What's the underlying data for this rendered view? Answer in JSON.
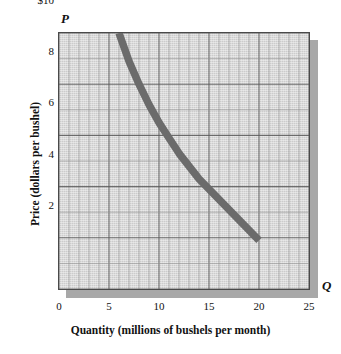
{
  "figure": {
    "axis_symbols": {
      "price": "P",
      "quantity": "Q"
    },
    "y_axis_title": "Price (dollars per bushel)",
    "x_axis_title": "Quantity (millions of bushels per month)"
  },
  "chart_data": {
    "type": "line",
    "title": "",
    "subtitle": "",
    "xlabel": "Quantity (millions of bushels per month)",
    "ylabel": "Price (dollars per bushel)",
    "xlim": [
      0,
      25
    ],
    "ylim": [
      0,
      10
    ],
    "grid": true,
    "grid_major_x_step": 5,
    "grid_major_y_step": 2,
    "grid_minor_x_step": 1,
    "grid_minor_y_step": 1,
    "legend": "none",
    "x_tick_labels": [
      "0",
      "5",
      "10",
      "15",
      "20",
      "25"
    ],
    "x_tick_values": [
      0,
      5,
      10,
      15,
      20,
      25
    ],
    "y_tick_labels": [
      "2",
      "4",
      "6",
      "8",
      "$10"
    ],
    "y_tick_values": [
      2,
      4,
      6,
      8,
      10
    ],
    "series": [
      {
        "name": "Demand",
        "style": "thick-gray-curve",
        "color": "#6b6b6b",
        "x": [
          6,
          7,
          8,
          9,
          10,
          11,
          12,
          13,
          14,
          15,
          16,
          17,
          18,
          19,
          20
        ],
        "y": [
          10.0,
          8.9,
          8.0,
          7.2,
          6.5,
          5.9,
          5.3,
          4.8,
          4.3,
          3.9,
          3.5,
          3.1,
          2.7,
          2.3,
          1.9
        ]
      }
    ]
  },
  "colors": {
    "panel_background": "#d9d9d9",
    "panel_shadow": "#a8a8a8",
    "panel_border": "#4a4a4a",
    "grid_major": "#5a5a5a",
    "grid_minor": "#8f8f8f",
    "curve": "#6b6b6b",
    "text": "#111111"
  }
}
